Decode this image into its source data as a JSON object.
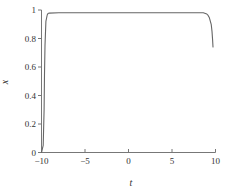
{
  "figure": {
    "background": "#ffffff",
    "axis_color": "#777777",
    "text_color": "#333333"
  },
  "chart_data": {
    "type": "line",
    "title": "",
    "xlabel": "t",
    "ylabel": "x",
    "xlim": [
      -10,
      10
    ],
    "ylim": [
      0,
      1
    ],
    "x_ticks": [
      -10,
      -5,
      0,
      5,
      10
    ],
    "x_tick_labels": [
      "−10",
      "−5",
      "0",
      "5",
      "10"
    ],
    "y_ticks": [
      0,
      0.2,
      0.4,
      0.6,
      0.8,
      1
    ],
    "y_tick_labels": [
      "0",
      "0.2",
      "0.4",
      "0.6",
      "0.8",
      "1"
    ],
    "grid": false,
    "legend": "none",
    "line_color": "#666666",
    "series": [
      {
        "name": "x(t)",
        "points": [
          [
            -10,
            0
          ],
          [
            -9.8,
            0.05
          ],
          [
            -9.7,
            0.3
          ],
          [
            -9.65,
            0.55
          ],
          [
            -9.6,
            0.75
          ],
          [
            -9.5,
            0.92
          ],
          [
            -9.35,
            0.965
          ],
          [
            -9.25,
            0.975
          ],
          [
            -9.1,
            0.978
          ],
          [
            -8,
            0.98
          ],
          [
            -6,
            0.98
          ],
          [
            -4,
            0.98
          ],
          [
            -2,
            0.98
          ],
          [
            0,
            0.98
          ],
          [
            2,
            0.98
          ],
          [
            4,
            0.98
          ],
          [
            6,
            0.98
          ],
          [
            8,
            0.98
          ],
          [
            8.6,
            0.98
          ],
          [
            9.0,
            0.972
          ],
          [
            9.15,
            0.962
          ],
          [
            9.3,
            0.945
          ],
          [
            9.5,
            0.9
          ],
          [
            9.6,
            0.85
          ],
          [
            9.67,
            0.79
          ],
          [
            9.71,
            0.74
          ]
        ]
      }
    ]
  }
}
